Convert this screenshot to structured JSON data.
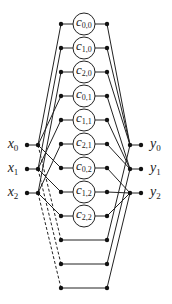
{
  "diagram": {
    "width": 172,
    "height": 304,
    "stroke_color": "#222222",
    "node_color": "#111111",
    "node_radius": 2.2,
    "circle_radius": 11,
    "columns": {
      "x_outer": 27,
      "x_inner": 38,
      "c_left": 61,
      "c_center": 84,
      "c_right": 107,
      "y_inner": 130,
      "y_outer": 141,
      "x_label": 13,
      "y_label": 150
    },
    "rows": [
      {
        "y": 24,
        "cell": {
          "label": "c",
          "sub": "0,0"
        },
        "from": 0,
        "to": 0
      },
      {
        "y": 48,
        "cell": {
          "label": "c",
          "sub": "1,0"
        },
        "from": 1,
        "to": 0
      },
      {
        "y": 72,
        "cell": {
          "label": "c",
          "sub": "2,0"
        },
        "from": 2,
        "to": 0
      },
      {
        "y": 96,
        "cell": {
          "label": "c",
          "sub": "0,1"
        },
        "from": 0,
        "to": 1
      },
      {
        "y": 120,
        "cell": {
          "label": "c",
          "sub": "1,1"
        },
        "from": 1,
        "to": 1
      },
      {
        "y": 144,
        "cell": {
          "label": "c",
          "sub": "2,1"
        },
        "from": 2,
        "to": 1
      },
      {
        "y": 168,
        "cell": {
          "label": "c",
          "sub": "0,2"
        },
        "from": 0,
        "to": 2
      },
      {
        "y": 192,
        "cell": {
          "label": "c",
          "sub": "1,2"
        },
        "from": 1,
        "to": 2
      },
      {
        "y": 216,
        "cell": {
          "label": "c",
          "sub": "2,2"
        },
        "from": 2,
        "to": 2
      },
      {
        "y": 240,
        "cell": null,
        "from": 0,
        "to": 0,
        "dashed": true
      },
      {
        "y": 264,
        "cell": null,
        "from": 1,
        "to": 1,
        "dashed": true
      },
      {
        "y": 288,
        "cell": null,
        "from": 2,
        "to": 2,
        "dashed": true
      }
    ],
    "inputs": [
      {
        "label": "x",
        "sub": "0",
        "y": 145
      },
      {
        "label": "x",
        "sub": "1",
        "y": 169
      },
      {
        "label": "x",
        "sub": "2",
        "y": 193
      }
    ],
    "outputs": [
      {
        "label": "y",
        "sub": "0",
        "y": 145
      },
      {
        "label": "y",
        "sub": "1",
        "y": 169
      },
      {
        "label": "y",
        "sub": "2",
        "y": 193
      }
    ]
  }
}
